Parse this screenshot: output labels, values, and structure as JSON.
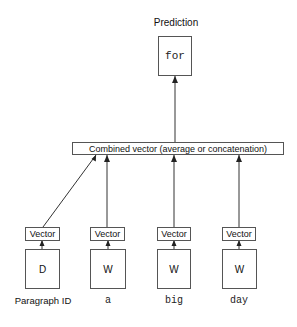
{
  "output": {
    "label": "Prediction",
    "token": "for"
  },
  "combined": {
    "label": "Combined vector (average or concatenation)"
  },
  "inputs": [
    {
      "vector_label": "Vector",
      "matrix_label": "D",
      "token": "Paragraph ID",
      "token_font": "sans"
    },
    {
      "vector_label": "Vector",
      "matrix_label": "W",
      "token": "a",
      "token_font": "mono"
    },
    {
      "vector_label": "Vector",
      "matrix_label": "W",
      "token": "big",
      "token_font": "mono"
    },
    {
      "vector_label": "Vector",
      "matrix_label": "W",
      "token": "day",
      "token_font": "mono"
    }
  ],
  "colors": {
    "line": "#333333",
    "border": "#555555",
    "background": "#ffffff"
  }
}
